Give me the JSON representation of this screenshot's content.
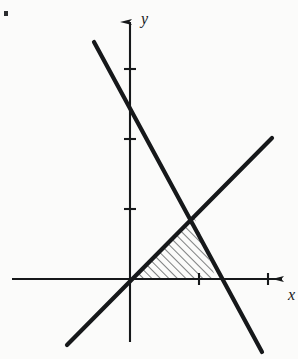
{
  "figure": {
    "kind": "cartesian-line-graph",
    "background_color": "#fbfbfa",
    "ink_color": "#16181a",
    "axis_labels": {
      "x": "x",
      "y": "y"
    },
    "origin_px": {
      "x": 130,
      "y": 279
    },
    "unit_px": 70,
    "axes": {
      "x_axis": {
        "x1": 12,
        "y1": 279,
        "x2": 288,
        "y2": 279,
        "arrow": "right"
      },
      "y_axis": {
        "x1": 130,
        "y1": 342,
        "x2": 130,
        "y2": 12,
        "arrow": "up"
      },
      "x_ticks_px": [
        199,
        268
      ],
      "y_ticks_px": [
        209,
        139,
        69
      ],
      "x_tick_values": [
        1,
        2
      ],
      "y_tick_values": [
        1,
        2,
        3
      ],
      "tick_half_length_px": 6
    },
    "lines": [
      {
        "name": "ascending-line",
        "description": "line rising left-to-right through the origin",
        "x1": 67,
        "y1": 345,
        "x2": 272,
        "y2": 138,
        "stroke_width": 4.2
      },
      {
        "name": "descending-line",
        "description": "steep line falling left-to-right",
        "x1": 94,
        "y1": 42,
        "x2": 262,
        "y2": 352,
        "stroke_width": 4.2
      }
    ],
    "intersection_px": {
      "x": 194,
      "y": 216
    },
    "shaded_region": {
      "name": "hatched-triangle",
      "vertices_px": [
        {
          "x": 130,
          "y": 279
        },
        {
          "x": 194,
          "y": 216
        },
        {
          "x": 216,
          "y": 279
        }
      ],
      "hatch_style": "diagonal-lines",
      "hatch_angle_deg": 45,
      "hatch_spacing_px": 6,
      "hatch_stroke_width": 1.1
    },
    "speck": {
      "x": 4,
      "y": 11,
      "w": 4,
      "h": 5
    }
  },
  "chart_data": {
    "type": "line",
    "title": "",
    "xlabel": "x",
    "ylabel": "y",
    "xlim": [
      -1.7,
      2.3
    ],
    "ylim": [
      -0.9,
      3.8
    ],
    "grid": false,
    "legend": "none",
    "x_ticks": [
      1,
      2
    ],
    "y_ticks": [
      1,
      2,
      3
    ],
    "series": [
      {
        "name": "ascending-line",
        "type": "line",
        "points": [
          [
            -0.9,
            -0.94
          ],
          [
            2.03,
            2.01
          ]
        ],
        "slope": 1,
        "intercept": 0
      },
      {
        "name": "descending-line",
        "type": "line",
        "points": [
          [
            -0.51,
            3.39
          ],
          [
            1.89,
            -1.04
          ]
        ],
        "slope": -1.85,
        "intercept": 2.44
      }
    ],
    "annotations": [
      {
        "name": "hatched-triangle",
        "type": "shaded-region",
        "vertices": [
          [
            0,
            0
          ],
          [
            0.91,
            0.9
          ],
          [
            1.23,
            0
          ]
        ]
      }
    ]
  }
}
